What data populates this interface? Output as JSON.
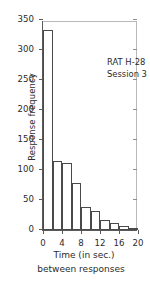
{
  "chart_data": {
    "type": "bar",
    "title": "",
    "subtitle": "",
    "xlabel": "Time (in sec.)",
    "xlabel_line2": "between responses",
    "ylabel": "Response frequency",
    "annotation_line1": "RAT H-28",
    "annotation_line2": "Session 3",
    "bin_width": 2,
    "xlim": [
      0,
      20
    ],
    "ylim": [
      0,
      350
    ],
    "grid": false,
    "legend": null,
    "x_ticks": [
      0,
      4,
      8,
      12,
      16,
      20
    ],
    "x_tick_labels": [
      "0",
      "4",
      "8",
      "12",
      "16",
      "20"
    ],
    "y_ticks": [
      0,
      50,
      100,
      150,
      200,
      250,
      300,
      350
    ],
    "y_tick_labels": [
      "0",
      "50",
      "100",
      "150",
      "200",
      "250",
      "300",
      "350"
    ],
    "bin_edges": [
      0,
      2,
      4,
      6,
      8,
      10,
      12,
      14,
      16,
      18,
      20
    ],
    "categories": [
      "0-2",
      "2-4",
      "4-6",
      "6-8",
      "8-10",
      "10-12",
      "12-14",
      "14-16",
      "16-18",
      "18-20"
    ],
    "values": [
      333,
      115,
      111,
      78,
      39,
      31,
      16,
      11,
      7,
      3
    ],
    "bar_fill_color": "#ffffff",
    "bar_edge_color": "#4a4a4a",
    "axis_color": "#5a5a5a",
    "background_color": "#ffffff"
  }
}
